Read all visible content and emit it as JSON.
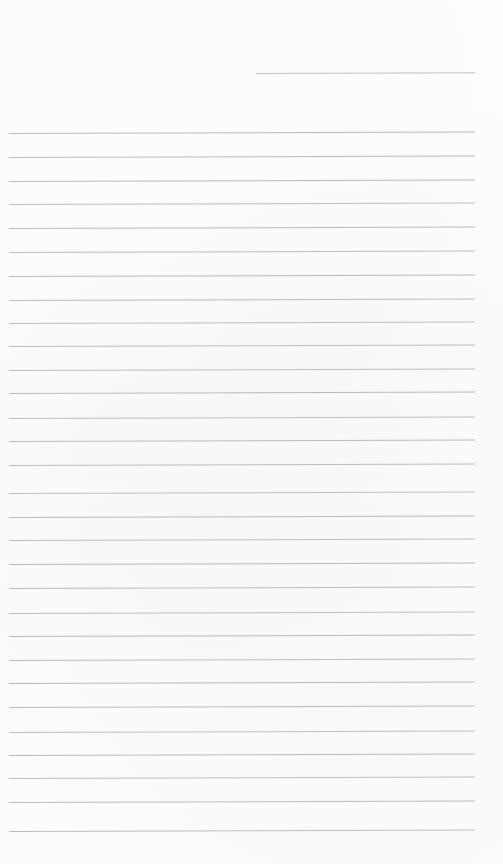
{
  "page": {
    "title": "Blank lined notebook page",
    "width": 503,
    "height": 864,
    "background_color": "#ffffff",
    "paper_type": "ruled",
    "content_text": "",
    "note": "No text, icons, or controls are present on this page."
  },
  "ruling": {
    "line_color": "#b8b8b8",
    "line_thickness_px": 1,
    "line_spacing_px": 23.8,
    "left_margin_px": 9,
    "right_margin_px": 475,
    "first_full_line_y_px": 133,
    "full_line_count": 30,
    "tilt_degrees": -0.18,
    "partial_line": {
      "y_px": 73,
      "start_x_px": 256,
      "end_x_px": 475,
      "description": "short rule at top right"
    }
  },
  "lines": [
    {
      "y": 73,
      "x1": 256,
      "x2": 475,
      "color": "#bdbdbd",
      "partial": true
    },
    {
      "y": 133,
      "x1": 9,
      "x2": 475,
      "color": "#b6b6b6",
      "partial": false
    },
    {
      "y": 157,
      "x1": 9,
      "x2": 475,
      "color": "#b8b8b8",
      "partial": false
    },
    {
      "y": 181,
      "x1": 9,
      "x2": 475,
      "color": "#b6b6b6",
      "partial": false
    },
    {
      "y": 204,
      "x1": 9,
      "x2": 475,
      "color": "#bababa",
      "partial": false
    },
    {
      "y": 228,
      "x1": 9,
      "x2": 475,
      "color": "#b7b7b7",
      "partial": false
    },
    {
      "y": 252,
      "x1": 9,
      "x2": 475,
      "color": "#b9b9b9",
      "partial": false
    },
    {
      "y": 276,
      "x1": 9,
      "x2": 475,
      "color": "#b6b6b6",
      "partial": false
    },
    {
      "y": 300,
      "x1": 9,
      "x2": 475,
      "color": "#b8b8b8",
      "partial": false
    },
    {
      "y": 323,
      "x1": 9,
      "x2": 475,
      "color": "#bbbbbb",
      "partial": false
    },
    {
      "y": 346,
      "x1": 9,
      "x2": 475,
      "color": "#b7b7b7",
      "partial": false
    },
    {
      "y": 370,
      "x1": 9,
      "x2": 475,
      "color": "#b9b9b9",
      "partial": false
    },
    {
      "y": 393,
      "x1": 9,
      "x2": 475,
      "color": "#b6b6b6",
      "partial": false
    },
    {
      "y": 418,
      "x1": 9,
      "x2": 475,
      "color": "#bababa",
      "partial": false
    },
    {
      "y": 441,
      "x1": 9,
      "x2": 475,
      "color": "#b7b7b7",
      "partial": false
    },
    {
      "y": 465,
      "x1": 9,
      "x2": 475,
      "color": "#b8b8b8",
      "partial": false
    },
    {
      "y": 493,
      "x1": 9,
      "x2": 475,
      "color": "#bcbcbc",
      "partial": false
    },
    {
      "y": 517,
      "x1": 9,
      "x2": 475,
      "color": "#b7b7b7",
      "partial": false
    },
    {
      "y": 540,
      "x1": 9,
      "x2": 475,
      "color": "#b9b9b9",
      "partial": false
    },
    {
      "y": 564,
      "x1": 9,
      "x2": 475,
      "color": "#b6b6b6",
      "partial": false
    },
    {
      "y": 588,
      "x1": 9,
      "x2": 475,
      "color": "#b8b8b8",
      "partial": false
    },
    {
      "y": 613,
      "x1": 9,
      "x2": 475,
      "color": "#bababa",
      "partial": false
    },
    {
      "y": 636,
      "x1": 9,
      "x2": 475,
      "color": "#b7b7b7",
      "partial": false
    },
    {
      "y": 660,
      "x1": 9,
      "x2": 475,
      "color": "#b9b9b9",
      "partial": false
    },
    {
      "y": 683,
      "x1": 9,
      "x2": 475,
      "color": "#b6b6b6",
      "partial": false
    },
    {
      "y": 707,
      "x1": 9,
      "x2": 475,
      "color": "#b8b8b8",
      "partial": false
    },
    {
      "y": 732,
      "x1": 9,
      "x2": 475,
      "color": "#bbbbbb",
      "partial": false
    },
    {
      "y": 755,
      "x1": 9,
      "x2": 475,
      "color": "#b7b7b7",
      "partial": false
    },
    {
      "y": 778,
      "x1": 9,
      "x2": 475,
      "color": "#b9b9b9",
      "partial": false
    },
    {
      "y": 802,
      "x1": 9,
      "x2": 475,
      "color": "#b6b6b6",
      "partial": false
    },
    {
      "y": 831,
      "x1": 9,
      "x2": 475,
      "color": "#b8b8b8",
      "partial": false
    }
  ]
}
